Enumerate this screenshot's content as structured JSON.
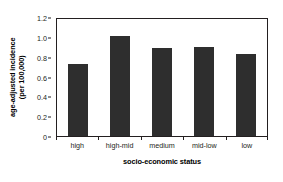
{
  "chart_data": {
    "type": "bar",
    "title": "",
    "subtitle": "",
    "categories": [
      "high",
      "high-mid",
      "medium",
      "mid-low",
      "low"
    ],
    "values": [
      0.73,
      1.01,
      0.89,
      0.9,
      0.83
    ],
    "series": [
      {
        "name": "age-adjusted incidence",
        "values": [
          0.73,
          1.01,
          0.89,
          0.9,
          0.83
        ]
      }
    ],
    "xlabel": "socio-economic status",
    "ylabel": "age-adjusted incidence (per 100,000)",
    "ylabel_line1": "age-adjusted incidence",
    "ylabel_line2": "(per 100,000)",
    "ylim": [
      0,
      1.2
    ],
    "yticks": [
      0,
      0.2,
      0.4,
      0.6,
      0.8,
      1.0,
      1.2
    ],
    "ytick_labels": [
      "0",
      "0.2",
      "0.4",
      "0.6",
      "0.8",
      "1.0",
      "1.2"
    ],
    "grid": false,
    "legend": false,
    "legend_position": "none",
    "bar_color": "#2e2e2e",
    "axis_color": "#231f20",
    "background_color": "#ffffff"
  }
}
